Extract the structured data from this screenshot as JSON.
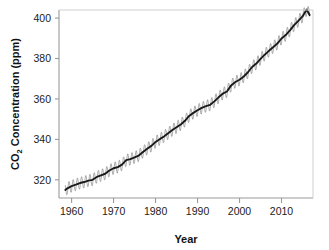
{
  "chart_data": {
    "type": "line",
    "title": "",
    "subtitle": "",
    "xlabel": "Year",
    "ylabel": "CO2 Concentration (ppm)",
    "ylabel_parts": {
      "prefix": "CO",
      "subscript": "2",
      "suffix": " Concentration (ppm)"
    },
    "xlim": [
      1957.0,
      2017.5
    ],
    "ylim": [
      311.0,
      404.0
    ],
    "xticks": [
      1960,
      1970,
      1980,
      1990,
      2000,
      2010
    ],
    "xtick_labels": [
      "1960",
      "1970",
      "1980",
      "1990",
      "2000",
      "2010"
    ],
    "yticks": [
      320,
      340,
      360,
      380,
      400
    ],
    "ytick_labels": [
      "320",
      "340",
      "360",
      "380",
      "400"
    ],
    "grid": false,
    "legend": false,
    "legend_position": "none",
    "frame_color": "#b8b8b8",
    "series": [
      {
        "name": "Monthly mean CO2 (seasonal cycle)",
        "color": "#8a8a8a",
        "style": "thin-line-with-seasonal-oscillation",
        "seasonal_amplitude_ppm": 3.0,
        "description": "Monthly observations showing annual sawtooth oscillation about the trend"
      },
      {
        "name": "Smoothed trend",
        "color": "#1a1a1a",
        "style": "thick-line",
        "x": [
          1958.5,
          1959,
          1960,
          1961,
          1962,
          1963,
          1964,
          1965,
          1966,
          1967,
          1968,
          1969,
          1970,
          1971,
          1972,
          1973,
          1974,
          1975,
          1976,
          1977,
          1978,
          1979,
          1980,
          1981,
          1982,
          1983,
          1984,
          1985,
          1986,
          1987,
          1988,
          1989,
          1990,
          1991,
          1992,
          1993,
          1994,
          1995,
          1996,
          1997,
          1998,
          1999,
          2000,
          2001,
          2002,
          2003,
          2004,
          2005,
          2006,
          2007,
          2008,
          2009,
          2010,
          2011,
          2012,
          2013,
          2014,
          2015,
          2016,
          2016.7
        ],
        "values": [
          315.0,
          315.8,
          316.9,
          317.6,
          318.4,
          318.9,
          319.6,
          320.0,
          321.4,
          322.2,
          323.0,
          324.6,
          325.7,
          326.3,
          327.5,
          329.7,
          330.2,
          331.1,
          332.0,
          333.8,
          335.4,
          336.8,
          338.7,
          340.1,
          341.4,
          343.0,
          344.6,
          346.0,
          347.4,
          349.2,
          351.6,
          353.1,
          354.4,
          355.6,
          356.4,
          357.1,
          358.8,
          360.8,
          362.6,
          363.7,
          366.7,
          368.4,
          369.5,
          371.1,
          373.2,
          375.8,
          377.5,
          379.8,
          381.9,
          383.8,
          385.6,
          387.4,
          389.9,
          391.6,
          393.9,
          396.5,
          398.6,
          400.8,
          404.2,
          401.5
        ],
        "description": "De-seasonalized smoothed Keeling curve"
      }
    ],
    "annotations": []
  },
  "figure": {
    "background_color": "#ffffff",
    "text_color": "#1c1c1c"
  }
}
